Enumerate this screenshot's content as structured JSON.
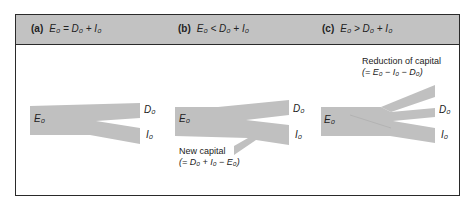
{
  "panels": [
    {
      "tag": "(a)",
      "condition": "E₀ = D₀ + I₀",
      "labels": {
        "source": "E₀",
        "top": "D₀",
        "bottom": "I₀"
      }
    },
    {
      "tag": "(b)",
      "condition": "E₀ < D₀ + I₀",
      "labels": {
        "source": "E₀",
        "top": "D₀",
        "bottom": "I₀"
      },
      "note": {
        "title": "New capital",
        "formula": "(= D₀ + I₀ − E₀)"
      }
    },
    {
      "tag": "(c)",
      "condition": "E₀ > D₀ + I₀",
      "labels": {
        "source": "E₀",
        "top": "D₀",
        "bottom": "I₀"
      },
      "note": {
        "title": "Reduction of capital",
        "formula": "(= E₀ − I₀ − D₀)"
      }
    }
  ],
  "colors": {
    "flow": "#c0c0c0",
    "header": "#c2c2c2",
    "border": "#2a2a2a"
  }
}
